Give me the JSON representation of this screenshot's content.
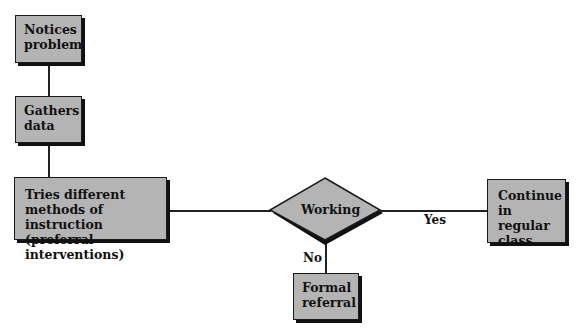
{
  "diagram": {
    "type": "flowchart",
    "nodes": {
      "notices": {
        "label": "Notices problem",
        "shape": "rectangle"
      },
      "gathers": {
        "label": "Gathers data",
        "shape": "rectangle"
      },
      "tries": {
        "label": "Tries different methods of instruction (preferral interventions)",
        "shape": "rectangle"
      },
      "working": {
        "label": "Working",
        "shape": "diamond"
      },
      "continue": {
        "label": "Continue in regular class",
        "shape": "rectangle"
      },
      "formal": {
        "label": "Formal referral",
        "shape": "rectangle"
      }
    },
    "edges": [
      {
        "from": "notices",
        "to": "gathers",
        "label": ""
      },
      {
        "from": "gathers",
        "to": "tries",
        "label": ""
      },
      {
        "from": "tries",
        "to": "working",
        "label": ""
      },
      {
        "from": "working",
        "to": "continue",
        "label": "Yes"
      },
      {
        "from": "working",
        "to": "formal",
        "label": "No"
      }
    ],
    "edge_labels": {
      "yes": "Yes",
      "no": "No"
    },
    "colors": {
      "box_fill": "#b4b4b4",
      "border": "#1a1a1a",
      "shadow": "#111111"
    }
  }
}
